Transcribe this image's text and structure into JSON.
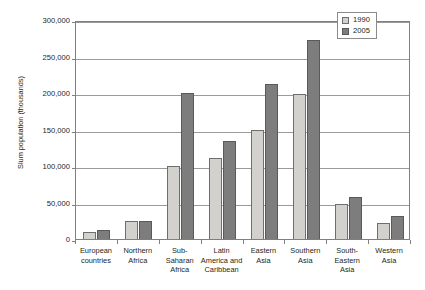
{
  "chart_data": {
    "type": "bar",
    "title": "",
    "xlabel": "",
    "ylabel": "Slum population (thousands)",
    "ylim": [
      0,
      300000
    ],
    "yticks": [
      0,
      50000,
      100000,
      150000,
      200000,
      250000,
      300000
    ],
    "ytick_labels": [
      "0",
      "50,000",
      "100,000",
      "150,000",
      "200,000",
      "250,000",
      "300,000"
    ],
    "grid": true,
    "legend_position": "top-right",
    "categories": [
      "European countries",
      "Northern Africa",
      "Sub-Saharan Africa",
      "Latin America and Caribbean",
      "Eastern Asia",
      "Southern Asia",
      "South-Eastern Asia",
      "Western Asia"
    ],
    "category_lines": [
      [
        "European",
        "countries"
      ],
      [
        "Northern",
        "Africa"
      ],
      [
        "Sub-",
        "Saharan",
        "Africa"
      ],
      [
        "Latin",
        "America and",
        "Caribbean"
      ],
      [
        "Eastern",
        "Asia"
      ],
      [
        "Southern",
        "Asia"
      ],
      [
        "South-",
        "Eastern",
        "Asia"
      ],
      [
        "Western",
        "Asia"
      ]
    ],
    "series": [
      {
        "name": "1990",
        "color": "#d2d1cd",
        "values": [
          10000,
          24000,
          100000,
          111000,
          150000,
          198000,
          48000,
          22000
        ]
      },
      {
        "name": "2005",
        "color": "#7d7d7d",
        "values": [
          13000,
          25000,
          200000,
          134000,
          212000,
          273000,
          57000,
          32000
        ]
      }
    ]
  },
  "legend": {
    "entries": [
      {
        "label": "1990"
      },
      {
        "label": "2005"
      }
    ]
  }
}
